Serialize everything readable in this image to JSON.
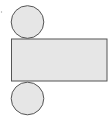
{
  "diagram": {
    "type": "cylinder-net",
    "colors": {
      "fill": "#e6e6e6",
      "stroke": "#555555",
      "background": "#ffffff"
    },
    "shapes": {
      "top_circle": {
        "cx": 27.5,
        "cy": 22,
        "r": 16.3
      },
      "rectangle": {
        "x": 11.5,
        "y": 39,
        "width": 95.5,
        "height": 42
      },
      "bottom_circle": {
        "cx": 27.5,
        "cy": 98.5,
        "r": 16.3
      },
      "speck": {
        "cx": 1.5,
        "cy": 12,
        "r": 0.7
      }
    }
  }
}
